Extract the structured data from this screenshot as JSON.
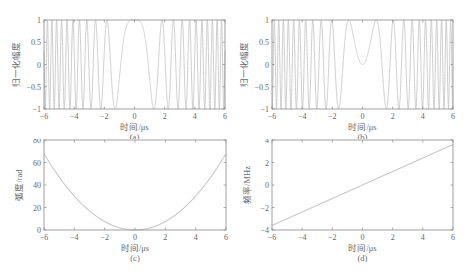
{
  "chart_data": [
    {
      "id": "a",
      "type": "line",
      "title": "",
      "caption": "(a)",
      "xlabel": "时间/μs",
      "ylabel": "归一化幅度",
      "xlim": [
        -6,
        6
      ],
      "ylim": [
        -1,
        1
      ],
      "xticks": [
        "-6",
        "-4",
        "-2",
        "0",
        "2",
        "4",
        "6"
      ],
      "yticks": [
        "-1",
        "-0.5",
        "0",
        "0.5",
        "1"
      ],
      "grid": false,
      "description": "Real part of LFM chirp: cos(pi*k*t^2), k≈0.6 MHz/μs; peak 1 at t=0, oscillation frequency increases with |t|",
      "series": [
        {
          "name": "cos(πkt²)",
          "formula": "cos(pi*0.6*t*t)"
        }
      ]
    },
    {
      "id": "b",
      "type": "line",
      "title": "",
      "caption": "(b)",
      "xlabel": "时间/μs",
      "ylabel": "归一化幅度",
      "xlim": [
        -6,
        6
      ],
      "ylim": [
        -1,
        1
      ],
      "xticks": [
        "-6",
        "-4",
        "-2",
        "0",
        "2",
        "4",
        "6"
      ],
      "yticks": [
        "-1",
        "-0.5",
        "0",
        "0.5",
        "1"
      ],
      "grid": false,
      "description": "Imaginary part of LFM chirp: sin(pi*k*t^2), value 0 at t=0, peaks near ±0.9 μs",
      "series": [
        {
          "name": "sin(πkt²)",
          "formula": "sin(pi*0.6*t*t)"
        }
      ]
    },
    {
      "id": "c",
      "type": "line",
      "title": "",
      "caption": "(c)",
      "xlabel": "时间/μs",
      "ylabel": "弧度/rad",
      "xlim": [
        -6,
        6
      ],
      "ylim": [
        0,
        80
      ],
      "xticks": [
        "-6",
        "-4",
        "-2",
        "0",
        "2",
        "4",
        "6"
      ],
      "yticks": [
        "0",
        "20",
        "40",
        "60",
        "80"
      ],
      "grid": false,
      "description": "Quadratic phase pi*k*t^2",
      "x": [
        -6,
        -4,
        -2,
        0,
        2,
        4,
        6
      ],
      "series": [
        {
          "name": "phase",
          "values": [
            67.9,
            30.2,
            7.5,
            0,
            7.5,
            30.2,
            67.9
          ]
        }
      ]
    },
    {
      "id": "d",
      "type": "line",
      "title": "",
      "caption": "(d)",
      "xlabel": "时间/μs",
      "ylabel": "频率/MHz",
      "xlim": [
        -6,
        6
      ],
      "ylim": [
        -4,
        4
      ],
      "xticks": [
        "-6",
        "-4",
        "-2",
        "0",
        "2",
        "4",
        "6"
      ],
      "yticks": [
        "-4",
        "-2",
        "0",
        "2",
        "4"
      ],
      "grid": false,
      "description": "Linear instantaneous frequency k*t",
      "x": [
        -6,
        -4,
        -2,
        0,
        2,
        4,
        6
      ],
      "series": [
        {
          "name": "frequency",
          "values": [
            -3.6,
            -2.4,
            -1.2,
            0,
            1.2,
            2.4,
            3.6
          ]
        }
      ]
    }
  ],
  "colors": {
    "line": "#c8c8c8",
    "axis": "#888888",
    "text": "#666666"
  }
}
